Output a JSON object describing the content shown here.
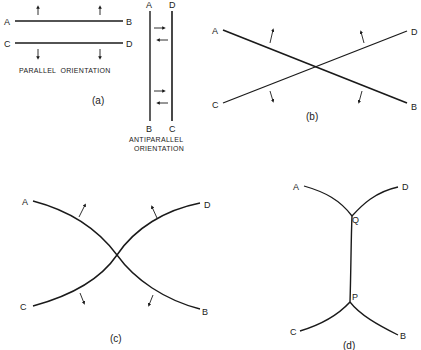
{
  "panel_a": {
    "caption": "(a)",
    "parallel": {
      "labels": {
        "a": "A",
        "b": "B",
        "c": "C",
        "d": "D"
      },
      "caption": "PARALLEL  ORIENTATION"
    },
    "antiparallel": {
      "labels": {
        "a": "A",
        "d": "D",
        "b": "B",
        "c": "C"
      },
      "caption_line1": "ANTIPARALLEL",
      "caption_line2": "ORIENTATION"
    }
  },
  "panel_b": {
    "caption": "(b)",
    "labels": {
      "a": "A",
      "b": "B",
      "c": "C",
      "d": "D"
    }
  },
  "panel_c": {
    "caption": "(c)",
    "labels": {
      "a": "A",
      "b": "B",
      "c": "C",
      "d": "D"
    }
  },
  "panel_d": {
    "caption": "(d)",
    "labels": {
      "a": "A",
      "b": "B",
      "c": "C",
      "d": "D",
      "q": "Q",
      "p": "P"
    }
  }
}
